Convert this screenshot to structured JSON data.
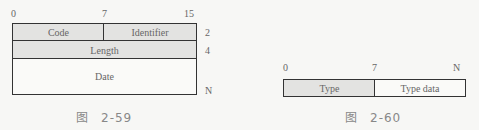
{
  "figure_59": {
    "bit_labels": [
      "0",
      "7",
      "15"
    ],
    "fields": [
      {
        "label": "Code",
        "row": 1
      },
      {
        "label": "Identifier",
        "row": 1
      },
      {
        "label": "Length",
        "row": 2
      },
      {
        "label": "Date",
        "row": 3
      }
    ],
    "byte_offsets": [
      "2",
      "4",
      "N"
    ],
    "caption_prefix": "图",
    "caption_number": "2-59"
  },
  "figure_60": {
    "bit_labels": [
      "0",
      "7",
      "N"
    ],
    "fields": [
      {
        "label": "Type"
      },
      {
        "label": "Type data"
      }
    ],
    "caption_prefix": "图",
    "caption_number": "2-60"
  },
  "colors": {
    "border": "#333333",
    "shaded_field": "#e3e3e1",
    "background": "#f7f7f5"
  }
}
